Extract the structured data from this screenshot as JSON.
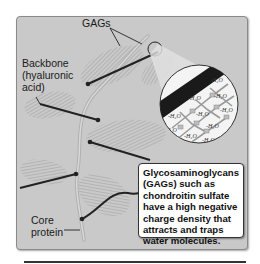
{
  "figure": {
    "labels": {
      "gags": "GAGs",
      "backbone_line1": "Backbone",
      "backbone_line2": "(hyaluronic",
      "backbone_line3": "acid)",
      "core_line1": "Core",
      "core_line2": "protein"
    },
    "callout": {
      "text": "Glycosaminoglycans (GAGs) such as chondroitin sulfate have a high negative charge density that attracts and traps water molecules."
    },
    "magnified_view": {
      "molecule_label": "H2O",
      "description": "Lattice of water molecules trapped by GAG chains"
    },
    "colors": {
      "panel_background": "#c9c9c9",
      "structure_lines": "#222222",
      "gag_bristles": "#9a9a9a",
      "core_protein": "#b8b8b8",
      "callout_background": "#ffffff"
    }
  }
}
